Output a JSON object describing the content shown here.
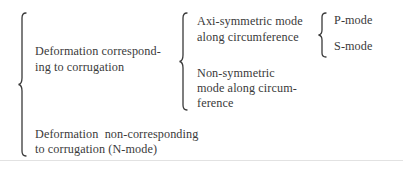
{
  "diagram": {
    "type": "classification-brace-tree",
    "root": {
      "children": [
        {
          "label_lines": [
            "Deformation correspond-",
            "ing to corrugation"
          ],
          "children": [
            {
              "label_lines": [
                "Axi-symmetric mode",
                "along circumference"
              ],
              "children": [
                {
                  "label": "P-mode"
                },
                {
                  "label": "S-mode"
                }
              ]
            },
            {
              "label_lines": [
                "Non-symmetric",
                "mode along circum-",
                "ference"
              ]
            }
          ]
        },
        {
          "label_lines": [
            "Deformation  non-corresponding",
            "to corrugation (N-mode)"
          ]
        }
      ]
    }
  },
  "colors": {
    "text": "#3a3a3a",
    "background": "#ffffff",
    "rule": "#e2e2e2"
  }
}
